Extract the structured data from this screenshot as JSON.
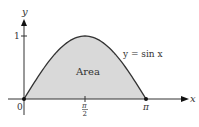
{
  "chart_data": {
    "type": "area",
    "title": "",
    "xlabel": "x",
    "ylabel": "y",
    "curve_label": "y = sin x",
    "area_label": "Area",
    "x_ticks": [
      "0",
      "π/2",
      "π"
    ],
    "y_ticks": [
      "1"
    ],
    "x": [
      0,
      0.3927,
      0.7854,
      1.1781,
      1.5708,
      1.9635,
      2.3562,
      2.7489,
      3.1416
    ],
    "y": [
      0,
      0.3827,
      0.7071,
      0.9239,
      1,
      0.9239,
      0.7071,
      0.3827,
      0
    ],
    "xlim": [
      0,
      3.1416
    ],
    "ylim": [
      0,
      1
    ],
    "fill_color": "#d9d9d9",
    "line_color": "#333333"
  },
  "labels": {
    "y_axis": "y",
    "x_axis": "x",
    "origin": "0",
    "one": "1",
    "pi": "π",
    "pi_num": "π",
    "pi_den": "2",
    "curve": "y = sin x",
    "area": "Area"
  }
}
